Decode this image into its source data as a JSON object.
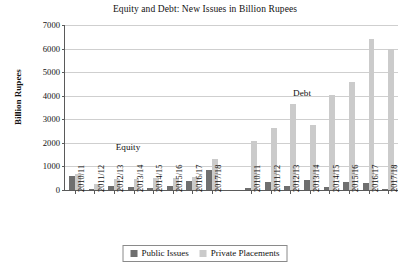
{
  "chart_data": {
    "type": "bar",
    "title": "Equity and Debt: New Issues in Billion Rupees",
    "xlabel": "",
    "ylabel": "Billion Rupees",
    "ylim": [
      0,
      7000
    ],
    "ytick_step": 1000,
    "yticks": [
      0,
      1000,
      2000,
      3000,
      4000,
      5000,
      6000,
      7000
    ],
    "grid": true,
    "legend_position": "bottom",
    "legend": [
      "Public Issues",
      "Private Placements"
    ],
    "groups": [
      {
        "name": "Equity",
        "annotation": "Equity",
        "categories": [
          "2010/11",
          "2011/12",
          "2012/13",
          "2013/14",
          "2014/15",
          "2015/16",
          "2016/17",
          "2017/18"
        ],
        "series": [
          {
            "name": "Public Issues",
            "values": [
              600,
              60,
              160,
              110,
              100,
              170,
              380,
              840
            ]
          },
          {
            "name": "Private Placements",
            "values": [
              660,
              260,
              460,
              480,
              520,
              520,
              560,
              1320
            ]
          }
        ]
      },
      {
        "name": "Debt",
        "annotation": "Debt",
        "categories": [
          "2010/11",
          "2011/12",
          "2012/13",
          "2013/14",
          "2014/15",
          "2015/16",
          "2016/17",
          "2017/18"
        ],
        "series": [
          {
            "name": "Public Issues",
            "values": [
              100,
              360,
              180,
              420,
              120,
              340,
              300,
              50
            ]
          },
          {
            "name": "Private Placements",
            "values": [
              2100,
              2620,
              3640,
              2760,
              4040,
              4580,
              6400,
              6000
            ]
          }
        ]
      }
    ]
  },
  "colors": {
    "public": "#6f6f6f",
    "private": "#cbcbcb",
    "axis": "#5a5a5a",
    "grid": "#cfcfcf",
    "text": "#111111"
  }
}
